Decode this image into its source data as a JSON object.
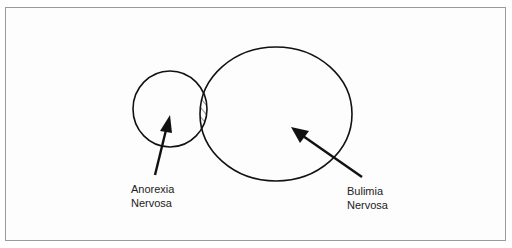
{
  "diagram": {
    "type": "venn",
    "sets": [
      {
        "name": "Anorexia Nervosa",
        "line1": "Anorexia",
        "line2": "Nervosa"
      },
      {
        "name": "Bulimia Nervosa",
        "line1": "Bulimia",
        "line2": "Nervosa"
      }
    ],
    "overlap_fill": "hatched",
    "colors": {
      "stroke": "#111111",
      "border": "#9a9a9a",
      "background": "#ffffff"
    }
  }
}
